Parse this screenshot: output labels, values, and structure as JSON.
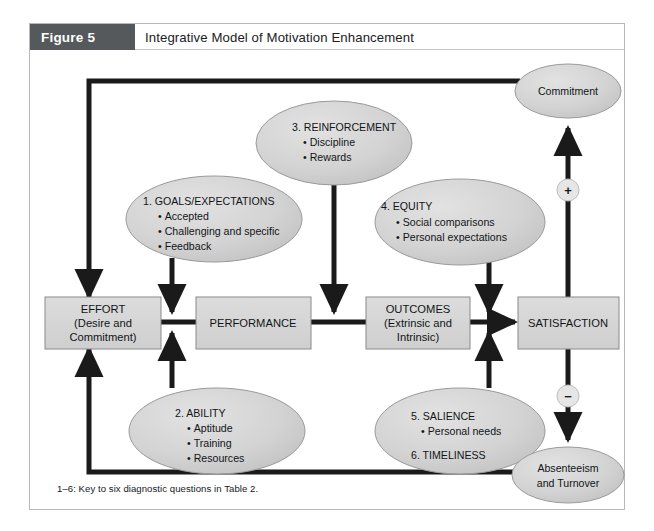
{
  "figure": {
    "tag": "Figure 5",
    "title": "Integrative Model of Motivation Enhancement",
    "caption": "1–6: Key to six diagnostic questions in Table 2."
  },
  "colors": {
    "tag_background": "#55595b",
    "tag_text": "#ffffff",
    "node_fill": "#d4d4d4",
    "node_stroke": "#808080",
    "oval_fill": "#d2d2d2",
    "oval_stroke": "#9a9a9a",
    "connector": "#1a1a1a",
    "frame_border": "#b9b9b9",
    "page_background": "#ffffff",
    "text": "#111517"
  },
  "chain": {
    "boxes": [
      {
        "id": "effort",
        "lines": [
          "EFFORT",
          "(Desire and",
          "Commitment)"
        ]
      },
      {
        "id": "performance",
        "lines": [
          "PERFORMANCE"
        ]
      },
      {
        "id": "outcomes",
        "lines": [
          "OUTCOMES",
          "(Extrinsic and",
          "Intrinsic)"
        ]
      },
      {
        "id": "satisfaction",
        "lines": [
          "SATISFACTION"
        ]
      }
    ]
  },
  "factors": [
    {
      "id": "goals",
      "title": "1. GOALS/EXPECTATIONS",
      "items": [
        "Accepted",
        "Challenging and specific",
        "Feedback"
      ],
      "extra": []
    },
    {
      "id": "ability",
      "title": "2. ABILITY",
      "items": [
        "Aptitude",
        "Training",
        "Resources"
      ],
      "extra": []
    },
    {
      "id": "reinforcement",
      "title": "3. REINFORCEMENT",
      "items": [
        "Discipline",
        "Rewards"
      ],
      "extra": []
    },
    {
      "id": "equity",
      "title": "4. EQUITY",
      "items": [
        "Social comparisons",
        "Personal expectations"
      ],
      "extra": []
    },
    {
      "id": "salience",
      "title": "5. SALIENCE",
      "items": [
        "Personal needs"
      ],
      "extra": [
        "6. TIMELINESS"
      ]
    }
  ],
  "outcome_ovals": [
    {
      "id": "commitment",
      "lines": [
        "Commitment"
      ]
    },
    {
      "id": "absenteeism",
      "lines": [
        "Absenteeism",
        "and Turnover"
      ]
    }
  ],
  "signs": [
    {
      "id": "positive",
      "symbol": "+"
    },
    {
      "id": "negative",
      "symbol": "−"
    }
  ],
  "bullet": "•"
}
